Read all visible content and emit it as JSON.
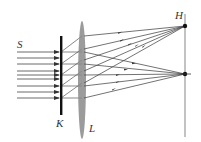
{
  "diagram": {
    "labels": {
      "source": "S",
      "slit_screen": "K",
      "lens": "L",
      "image_screen": "H"
    },
    "colors": {
      "ray": "#444444",
      "slit_screen": "#111111",
      "lens": "#8a8a8a",
      "image_screen": "#9a9a9a",
      "point": "#111111"
    },
    "incident_rays_y": [
      52,
      58,
      64,
      71,
      75,
      79,
      86,
      92,
      98
    ],
    "focal_points": [
      {
        "x": 185,
        "y": 26
      },
      {
        "x": 185,
        "y": 74
      }
    ]
  }
}
